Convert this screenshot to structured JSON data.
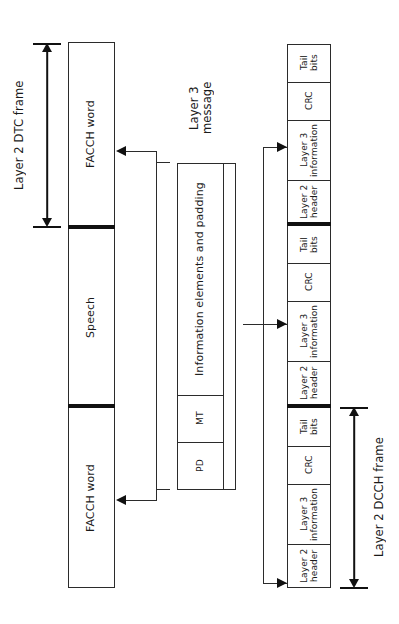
{
  "diagram": {
    "title_hidden": "",
    "labels": {
      "dtc_frame": "Layer 2 DTC frame",
      "dcch_frame": "Layer 2 DCCH frame",
      "layer3_message": "Layer 3 message"
    },
    "left_column": {
      "name": "Layer 2 DTC frame stack",
      "segments": [
        {
          "id": "facch-top",
          "label": "FACCH word"
        },
        {
          "id": "speech",
          "label": "Speech"
        },
        {
          "id": "facch-bottom",
          "label": "FACCH word"
        }
      ]
    },
    "middle_column": {
      "name": "Layer 3 message block",
      "segments": [
        {
          "id": "info-elements",
          "label": "Information elements and padding"
        },
        {
          "id": "mt",
          "label": "MT"
        },
        {
          "id": "pd",
          "label": "PD"
        }
      ]
    },
    "right_column": {
      "name": "Layer 2 DCCH frame stack",
      "segments": [
        {
          "id": "f1-tail",
          "label": "Tail\nbits"
        },
        {
          "id": "f1-crc",
          "label": "CRC"
        },
        {
          "id": "f1-l3info",
          "label": "Layer 3\ninformation"
        },
        {
          "id": "f1-l2hdr",
          "label": "Layer 2\nheader"
        },
        {
          "id": "f2-tail",
          "label": "Tail\nbits"
        },
        {
          "id": "f2-crc",
          "label": "CRC"
        },
        {
          "id": "f2-l3info",
          "label": "Layer 3\ninformation"
        },
        {
          "id": "f2-l2hdr",
          "label": "Layer 2\nheader"
        },
        {
          "id": "f3-tail",
          "label": "Tail\nbits"
        },
        {
          "id": "f3-crc",
          "label": "CRC"
        },
        {
          "id": "f3-l3info",
          "label": "Layer 3\ninformation"
        },
        {
          "id": "f3-l2hdr",
          "label": "Layer 2\nheader"
        }
      ]
    },
    "colors": {
      "stroke": "#2b2b2b",
      "thick_stroke": "#111111",
      "background": "#ffffff",
      "text": "#1a1a1a"
    }
  }
}
